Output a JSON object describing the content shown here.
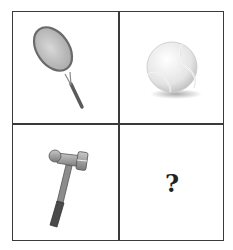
{
  "puzzle": {
    "cells": [
      {
        "position": "top-left",
        "item": "tennis-racket"
      },
      {
        "position": "top-right",
        "item": "tennis-ball"
      },
      {
        "position": "bottom-left",
        "item": "hammer"
      },
      {
        "position": "bottom-right",
        "item": "unknown"
      }
    ],
    "question_mark": "?"
  },
  "colors": {
    "grid_line": "#3a3a3a",
    "icon_gray": "#8a8a8a",
    "icon_dark": "#4a4a4a",
    "background": "#ffffff"
  }
}
